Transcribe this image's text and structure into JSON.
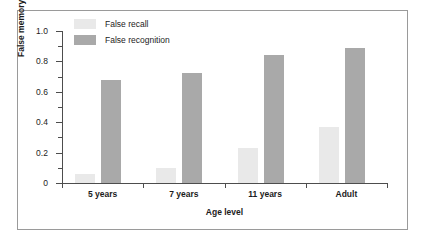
{
  "chart_data": {
    "type": "bar",
    "title": "",
    "xlabel": "Age level",
    "ylabel": "False memory level",
    "categories": [
      "5 years",
      "7 years",
      "11 years",
      "Adult"
    ],
    "series": [
      {
        "name": "False recall",
        "color": "#e9e9e9",
        "values": [
          0.06,
          0.1,
          0.23,
          0.37
        ]
      },
      {
        "name": "False recognition",
        "color": "#a9a9a9",
        "values": [
          0.68,
          0.725,
          0.84,
          0.89
        ]
      }
    ],
    "ylim": [
      0,
      1.0
    ],
    "ytick_labels": [
      "0",
      "0.2",
      "0.4",
      "0.6",
      "0.8",
      "1.0"
    ],
    "ytick_values": [
      0,
      0.2,
      0.4,
      0.6,
      0.8,
      1.0
    ],
    "yminor_values": [
      0.1,
      0.3,
      0.5,
      0.7,
      0.9
    ],
    "grid": false,
    "legend_position": "top-left"
  },
  "figure": {
    "border_color": "#9a9a9a",
    "background": "#ffffff"
  }
}
